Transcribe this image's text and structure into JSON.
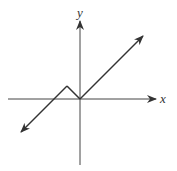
{
  "diagram": {
    "type": "coordinate-graph",
    "axes": {
      "x_label": "x",
      "y_label": "y"
    },
    "curve": {
      "description": "piecewise linear graph with arrows at both ends, a peak left of the y-axis and a vertex at the origin",
      "points": [
        [
          -5,
          -3
        ],
        [
          -1,
          1
        ],
        [
          0,
          0
        ],
        [
          5,
          5
        ]
      ]
    },
    "colors": {
      "line": "#333333",
      "background": "#ffffff"
    }
  }
}
